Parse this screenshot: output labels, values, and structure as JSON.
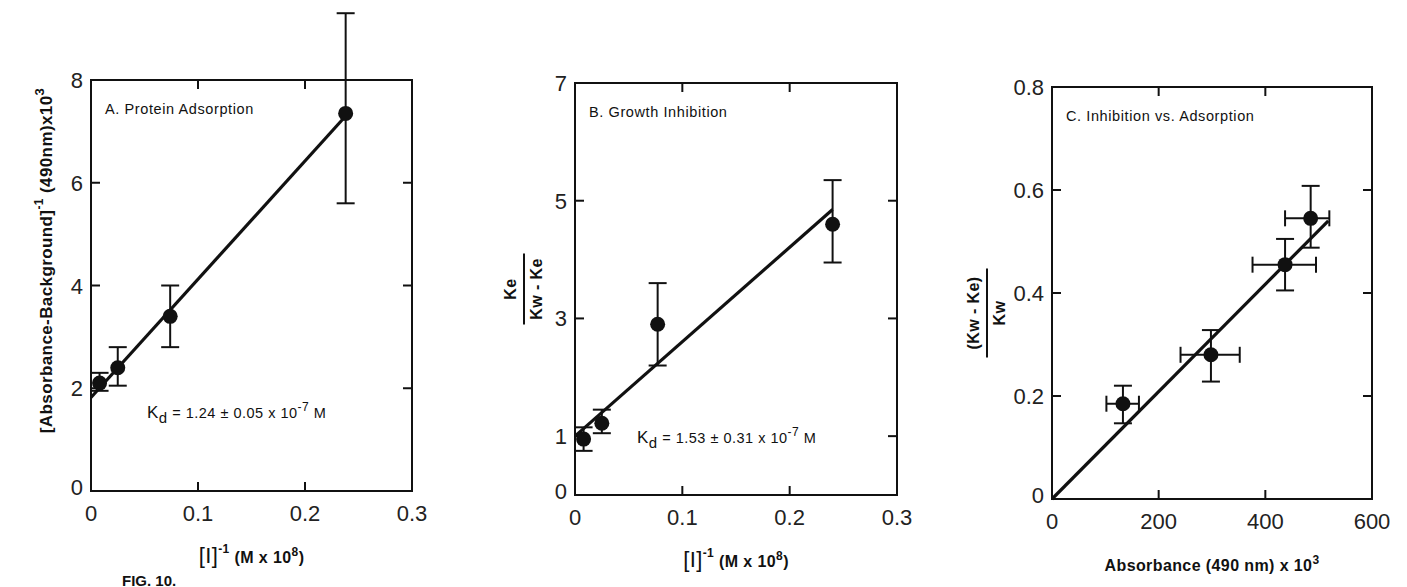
{
  "figure": {
    "caption_visible": "FIG. 10."
  },
  "chart_data": [
    {
      "id": "A",
      "type": "scatter",
      "title": "A. Protein Adsorption",
      "xlabel": "[I]⁻¹  (M x 10⁸)",
      "xlabel_parts": {
        "main": "[I]",
        "sup": "-1",
        "unit": "(M x 10",
        "unit_sup": "8",
        "unit_end": ")"
      },
      "ylabel": "[Absorbance-Background]⁻¹ (490nm) x 10³",
      "ylabel_parts": {
        "main": "[Absorbance-Background]",
        "sup": "-1",
        "rest": "(490nm)x10",
        "rest_sup": "3"
      },
      "xlim": [
        0,
        0.3
      ],
      "ylim": [
        0,
        8
      ],
      "xticks": [
        0,
        0.1,
        0.2,
        0.3
      ],
      "xtick_labels": [
        "0",
        "0.1",
        "0.2",
        "0.3"
      ],
      "yticks": [
        0,
        2,
        4,
        6,
        8
      ],
      "ytick_labels": [
        "0",
        "2",
        "4",
        "6",
        "8"
      ],
      "grid": false,
      "points": [
        {
          "x": 0.008,
          "y": 2.1,
          "ylo": 1.95,
          "yhi": 2.3
        },
        {
          "x": 0.025,
          "y": 2.4,
          "ylo": 2.05,
          "yhi": 2.8
        },
        {
          "x": 0.074,
          "y": 3.4,
          "ylo": 2.8,
          "yhi": 4.0
        },
        {
          "x": 0.238,
          "y": 7.35,
          "ylo": 5.6,
          "yhi": 9.3
        }
      ],
      "fit": {
        "x0": 0,
        "y0": 1.82,
        "x1": 0.238,
        "y1": 7.3
      },
      "annotation": {
        "text": "Kd = 1.24 ± 0.05 x 10⁻⁷ M",
        "k": "K",
        "sub": "d",
        "body": " = 1.24 ± 0.05  x  10",
        "sup": "-7",
        "tail": " M"
      }
    },
    {
      "id": "B",
      "type": "scatter",
      "title": "B. Growth Inhibition",
      "xlabel": "[I]⁻¹  (M x 10⁸)",
      "xlabel_parts": {
        "main": "[I]",
        "sup": "-1",
        "unit": "(M x 10",
        "unit_sup": "8",
        "unit_end": ")"
      },
      "ylabel": "Ke / (Kw - Ke)",
      "ylabel_parts": {
        "num": "Ke",
        "den": "Kw - Ke"
      },
      "xlim": [
        0,
        0.3
      ],
      "ylim": [
        0,
        7
      ],
      "xticks": [
        0,
        0.1,
        0.2,
        0.3
      ],
      "xtick_labels": [
        "0",
        "0.1",
        "0.2",
        "0.3"
      ],
      "yticks": [
        0,
        1,
        3,
        5,
        7
      ],
      "ytick_labels": [
        "0",
        "1",
        "3",
        "5",
        "7"
      ],
      "grid": false,
      "points": [
        {
          "x": 0.008,
          "y": 0.95,
          "ylo": 0.75,
          "yhi": 1.15
        },
        {
          "x": 0.025,
          "y": 1.22,
          "ylo": 1.05,
          "yhi": 1.45
        },
        {
          "x": 0.077,
          "y": 2.9,
          "ylo": 2.2,
          "yhi": 3.6
        },
        {
          "x": 0.24,
          "y": 4.6,
          "ylo": 3.95,
          "yhi": 5.35
        }
      ],
      "fit": {
        "x0": 0,
        "y0": 1.0,
        "x1": 0.24,
        "y1": 4.85
      },
      "annotation": {
        "text": "Kd = 1.53 ± 0.31 x 10⁻⁷ M",
        "k": "K",
        "sub": "d",
        "body": " = 1.53 ± 0.31  x  10",
        "sup": "-7",
        "tail": " M"
      }
    },
    {
      "id": "C",
      "type": "scatter",
      "title": "C. Inhibition vs. Adsorption",
      "xlabel": "Absorbance (490 nm) x 10³",
      "xlabel_parts": {
        "main": "Absorbance (490 nm) x 10",
        "sup": "3"
      },
      "ylabel": "(Kw - Ke) / Kw",
      "ylabel_parts": {
        "num": "(Kw - Ke)",
        "den": "Kw"
      },
      "xlim": [
        0,
        600
      ],
      "ylim": [
        0,
        0.8
      ],
      "xticks": [
        0,
        200,
        400,
        600
      ],
      "xtick_labels": [
        "0",
        "200",
        "400",
        "600"
      ],
      "yticks": [
        0,
        0.2,
        0.4,
        0.6,
        0.8
      ],
      "ytick_labels": [
        "0",
        "0.2",
        "0.4",
        "0.6",
        "0.8"
      ],
      "grid": false,
      "points": [
        {
          "x": 133,
          "y": 0.185,
          "ylo": 0.147,
          "yhi": 0.22,
          "xlo": 102,
          "xhi": 163
        },
        {
          "x": 298,
          "y": 0.28,
          "ylo": 0.228,
          "yhi": 0.328,
          "xlo": 241,
          "xhi": 352
        },
        {
          "x": 437,
          "y": 0.455,
          "ylo": 0.405,
          "yhi": 0.505,
          "xlo": 376,
          "xhi": 495
        },
        {
          "x": 485,
          "y": 0.545,
          "ylo": 0.488,
          "yhi": 0.608,
          "xlo": 437,
          "xhi": 520
        }
      ],
      "fit": {
        "x0": 0,
        "y0": 0.0,
        "x1": 518,
        "y1": 0.54
      }
    }
  ]
}
